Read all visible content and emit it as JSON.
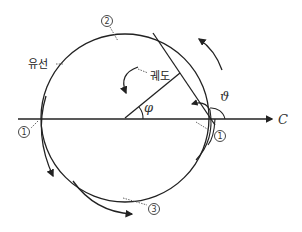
{
  "diagram": {
    "title": "",
    "labels": {
      "streamline": "유선",
      "trajectory": "궤도",
      "angle_phi": "φ",
      "angle_theta": "ϑ",
      "axis_c": "C"
    },
    "markers": [
      {
        "id": "marker-1-left",
        "text": "1"
      },
      {
        "id": "marker-1-right",
        "text": "1"
      },
      {
        "id": "marker-2-top",
        "text": "2"
      },
      {
        "id": "marker-3-bottom",
        "text": "3"
      }
    ],
    "colors": {
      "line": "#222222",
      "background": "#ffffff"
    }
  }
}
